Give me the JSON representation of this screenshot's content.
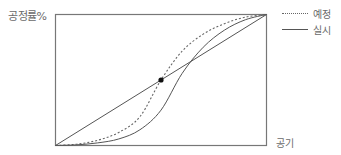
{
  "chart_data": {
    "type": "line",
    "title": "",
    "ylabel": "공정률%",
    "xlabel": "공기",
    "xlim": [
      0,
      100
    ],
    "ylim": [
      0,
      100
    ],
    "grid": false,
    "legend_position": "top-right-outside",
    "legend": [
      {
        "label": "예정",
        "style": "dotted"
      },
      {
        "label": "실시",
        "style": "solid"
      }
    ],
    "series": [
      {
        "name": "예정",
        "style": "dotted",
        "x": [
          0,
          10,
          20,
          30,
          40,
          50,
          60,
          70,
          80,
          90,
          100
        ],
        "y": [
          0,
          1,
          4,
          10,
          22,
          50,
          72,
          85,
          93,
          98,
          100
        ]
      },
      {
        "name": "실시",
        "style": "solid",
        "x": [
          0,
          10,
          20,
          30,
          40,
          50,
          60,
          70,
          80,
          90,
          100
        ],
        "y": [
          0,
          0.5,
          2,
          5,
          12,
          27,
          55,
          75,
          88,
          96,
          100
        ]
      },
      {
        "name": "diagonal",
        "style": "solid",
        "x": [
          0,
          100
        ],
        "y": [
          0,
          100
        ]
      }
    ],
    "annotations": [
      {
        "type": "point",
        "x": 50,
        "y": 50,
        "label": "",
        "marker": "filled-circle"
      }
    ]
  },
  "labels": {
    "y_axis": "공정률%",
    "x_axis": "공기",
    "legend_planned": "예정",
    "legend_actual": "실시"
  }
}
